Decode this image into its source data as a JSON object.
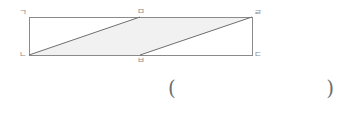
{
  "figure": {
    "type": "geometry-diagram",
    "shape": "rectangle-with-two-parallel-diagonals",
    "stroke_color": "#8a8a8a",
    "shaded_fill_color": "#f1f1f1",
    "rectangle": {
      "left": 29,
      "top": 17,
      "right": 252,
      "bottom": 55
    },
    "midpoints_x": 140,
    "vertices": [
      {
        "id": "top-left",
        "label": "ㄱ",
        "x": 29,
        "y": 17,
        "label_x": 19,
        "label_y": 8
      },
      {
        "id": "top-middle",
        "label": "ㅁ",
        "x": 140,
        "y": 17,
        "label_x": 137,
        "label_y": 7
      },
      {
        "id": "top-right",
        "label": "ㄹ",
        "x": 252,
        "y": 17,
        "label_x": 254,
        "label_y": 8
      },
      {
        "id": "bottom-left",
        "label": "ㄴ",
        "x": 29,
        "y": 55,
        "label_x": 19,
        "label_y": 50
      },
      {
        "id": "bottom-middle",
        "label": "ㅂ",
        "x": 140,
        "y": 55,
        "label_x": 137,
        "label_y": 56
      },
      {
        "id": "bottom-right",
        "label": "ㄷ",
        "x": 252,
        "y": 55,
        "label_x": 254,
        "label_y": 50
      }
    ],
    "diagonals": [
      {
        "id": "diagonal-left",
        "from": "bottom-left",
        "to": "top-middle"
      },
      {
        "id": "diagonal-right",
        "from": "bottom-middle",
        "to": "top-right"
      }
    ],
    "shaded_region": {
      "id": "parallelogram-shaded",
      "vertex_order": [
        "bottom-left",
        "top-middle",
        "top-right",
        "bottom-middle"
      ],
      "points": "29,55 140,17 252,17 140,55"
    }
  },
  "answer_blank": {
    "open_paren": "(",
    "close_paren": ")",
    "value": ""
  }
}
